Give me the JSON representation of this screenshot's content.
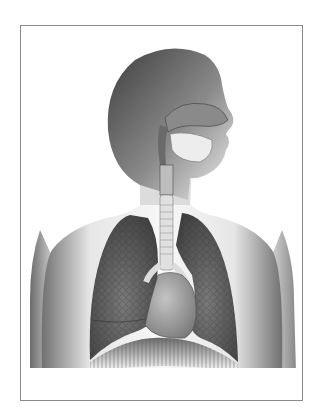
{
  "figure": {
    "style": "grayscale anatomical illustration",
    "colors": {
      "background": "#ffffff",
      "frame_border": "#8a8a8a",
      "skin_dark": "#4a4a4a",
      "skin_light": "#f2f2f2",
      "lung": "#5a5a5a",
      "heart": "#9a9a9a",
      "airway": "#d8d8d8"
    },
    "parts": [
      "head",
      "nasal-cavity",
      "trachea",
      "left-lung",
      "right-lung",
      "heart",
      "diaphragm",
      "torso",
      "arms"
    ]
  }
}
